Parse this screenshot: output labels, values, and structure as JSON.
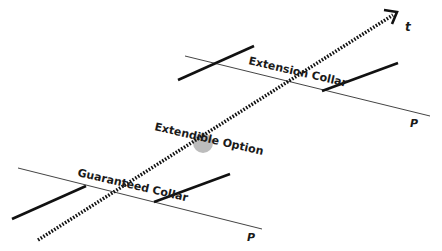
{
  "diagram": {
    "time_axis": {
      "label": "t",
      "style": "dotted-arrow"
    },
    "collars": [
      {
        "label": "Extension Collar",
        "price_axis_label": "P",
        "position": "upper"
      },
      {
        "label": "Guaranteed Collar",
        "price_axis_label": "P",
        "position": "lower"
      }
    ],
    "option": {
      "label": "Extendible Option",
      "marker_color": "#b5b5b5"
    },
    "colors": {
      "line": "#111111",
      "thin_line": "#444444",
      "marker": "#b5b5b5"
    }
  }
}
